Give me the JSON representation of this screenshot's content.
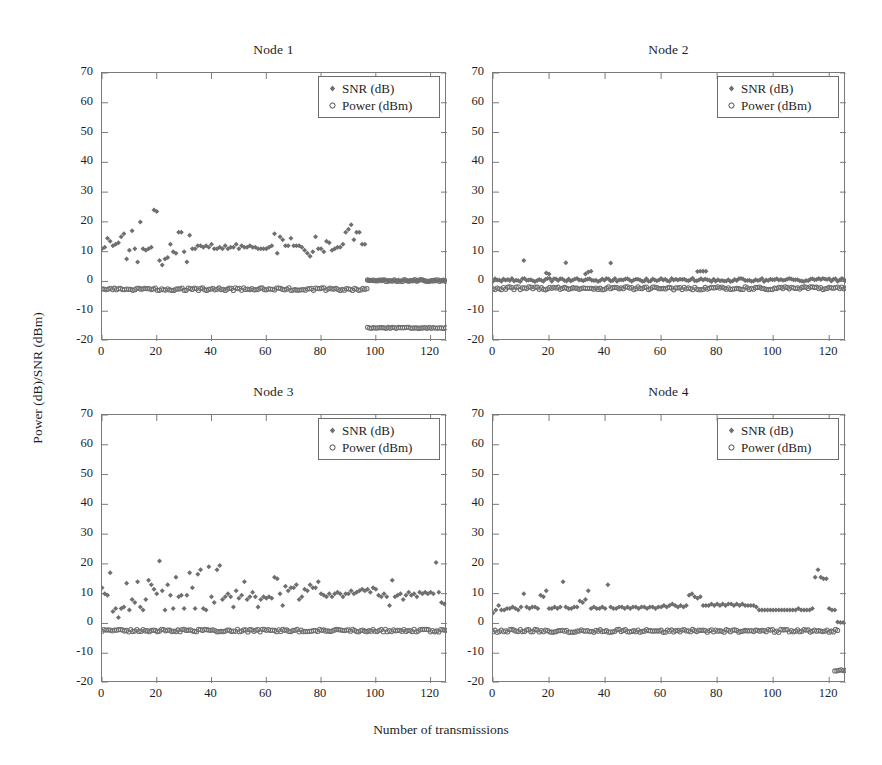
{
  "figure": {
    "ylabel": "Power (dB)/SNR (dBm)",
    "xlabel": "Number of transmissions",
    "marker_color": "#6f6f6f",
    "axis_color": "#7a7a7a",
    "text_color": "#1e1e1e"
  },
  "legend": {
    "snr_label": "SNR (dB)",
    "power_label": "Power (dBm)",
    "snr_marker": "diamond-marker-icon",
    "power_marker": "circle-marker-icon"
  },
  "axis": {
    "y_ticks": [
      "70",
      "60",
      "50",
      "40",
      "30",
      "20",
      "10",
      "0",
      "-10",
      "-20"
    ],
    "y_tick_values": [
      70,
      60,
      50,
      40,
      30,
      20,
      10,
      0,
      -10,
      -20
    ],
    "x_ticks": [
      "0",
      "20",
      "40",
      "60",
      "80",
      "100",
      "120"
    ],
    "x_tick_values": [
      0,
      20,
      40,
      60,
      80,
      100,
      120
    ],
    "xlim": [
      0,
      126
    ],
    "ylim": [
      -20,
      70
    ]
  },
  "chart_data": [
    {
      "type": "scatter",
      "title": "Node 1",
      "xlabel": "Number of transmissions",
      "ylabel": "Power (dB)/SNR (dBm)",
      "xlim": [
        0,
        126
      ],
      "ylim": [
        -20,
        70
      ],
      "grid": false,
      "legend_position": "top-right",
      "series": [
        {
          "name": "SNR (dB)",
          "marker": "diamond",
          "color": "#6f6f6f",
          "x": [
            0,
            1,
            2,
            3,
            4,
            5,
            6,
            7,
            8,
            9,
            10,
            11,
            12,
            13,
            14,
            15,
            16,
            17,
            18,
            19,
            20,
            21,
            22,
            23,
            24,
            25,
            26,
            27,
            28,
            29,
            30,
            31,
            32,
            33,
            34,
            35,
            36,
            37,
            38,
            39,
            40,
            41,
            42,
            43,
            44,
            45,
            46,
            47,
            48,
            49,
            50,
            51,
            52,
            53,
            54,
            55,
            56,
            57,
            58,
            59,
            60,
            61,
            62,
            63,
            64,
            65,
            66,
            67,
            68,
            69,
            70,
            71,
            72,
            73,
            74,
            75,
            76,
            77,
            78,
            79,
            80,
            81,
            82,
            83,
            84,
            85,
            86,
            87,
            88,
            89,
            90,
            91,
            92,
            93,
            94,
            95,
            96
          ],
          "y": [
            11.0,
            11.5,
            14.5,
            13.5,
            12.0,
            12.5,
            13.0,
            15.0,
            16.0,
            7.5,
            10.5,
            17.0,
            11.0,
            6.5,
            20.0,
            11.0,
            10.5,
            11.0,
            11.5,
            24.0,
            23.5,
            7.0,
            5.5,
            7.5,
            8.0,
            12.5,
            10.0,
            9.5,
            16.5,
            16.5,
            10.0,
            6.5,
            15.5,
            11.0,
            11.0,
            12.0,
            12.0,
            11.5,
            12.0,
            11.5,
            12.5,
            11.0,
            11.0,
            11.5,
            11.0,
            12.0,
            11.0,
            11.5,
            11.5,
            12.5,
            11.0,
            12.0,
            11.5,
            11.5,
            12.0,
            11.5,
            11.5,
            11.0,
            11.0,
            11.0,
            11.0,
            11.5,
            12.0,
            16.0,
            9.5,
            15.0,
            14.0,
            12.0,
            12.0,
            14.5,
            12.0,
            12.0,
            12.0,
            11.5,
            10.5,
            9.5,
            8.5,
            10.0,
            15.0,
            11.0,
            11.0,
            10.0,
            13.5,
            13.0,
            10.5,
            11.0,
            11.5,
            11.5,
            12.5,
            16.5,
            17.5,
            19.0,
            14.0,
            16.5,
            16.5,
            12.5,
            12.5
          ]
        },
        {
          "name": "Power (dBm) segment A",
          "marker": "circle",
          "color": "#6f6f6f",
          "x_range": [
            0,
            97
          ],
          "level": -2.6,
          "jitter": 0.45
        },
        {
          "name": "Power (dBm) segment B",
          "marker": "circle",
          "color": "#6f6f6f",
          "x_range": [
            97,
            126
          ],
          "level": 0.3,
          "jitter": 0.3
        },
        {
          "name": "Power (dBm) segment C",
          "marker": "circle",
          "color": "#6f6f6f",
          "x_range": [
            97,
            126
          ],
          "level": -15.6,
          "jitter": 0.2
        },
        {
          "name": "SNR (dB) tail",
          "marker": "diamond",
          "color": "#6f6f6f",
          "x_range": [
            97,
            126
          ],
          "level": 0.3,
          "jitter": 0.25
        }
      ]
    },
    {
      "type": "scatter",
      "title": "Node 2",
      "xlabel": "Number of transmissions",
      "ylabel": "Power (dB)/SNR (dBm)",
      "xlim": [
        0,
        126
      ],
      "ylim": [
        -20,
        70
      ],
      "grid": false,
      "legend_position": "top-right",
      "series": [
        {
          "name": "SNR (dB)",
          "marker": "diamond",
          "color": "#6f6f6f",
          "baseline": 0.5,
          "jitter": 0.55,
          "x_range": [
            0,
            126
          ],
          "outliers_x": [
            11,
            19,
            20,
            26,
            33,
            34,
            35,
            42,
            73,
            74,
            75,
            76
          ],
          "outliers_y": [
            7.0,
            2.8,
            2.5,
            6.3,
            2.5,
            3.2,
            3.4,
            6.2,
            3.3,
            3.4,
            3.4,
            3.4
          ]
        },
        {
          "name": "Power (dBm)",
          "marker": "circle",
          "color": "#6f6f6f",
          "x_range": [
            0,
            126
          ],
          "level": -2.3,
          "jitter": 0.5
        }
      ]
    },
    {
      "type": "scatter",
      "title": "Node 3",
      "xlabel": "Number of transmissions",
      "ylabel": "Power (dB)/SNR (dBm)",
      "xlim": [
        0,
        126
      ],
      "ylim": [
        -20,
        70
      ],
      "grid": false,
      "legend_position": "top-right",
      "series": [
        {
          "name": "SNR (dB)",
          "marker": "diamond",
          "color": "#6f6f6f",
          "x": [
            0,
            1,
            2,
            3,
            4,
            5,
            6,
            7,
            8,
            9,
            10,
            11,
            12,
            13,
            14,
            15,
            16,
            17,
            18,
            19,
            20,
            21,
            22,
            23,
            24,
            25,
            26,
            27,
            28,
            29,
            30,
            31,
            32,
            33,
            34,
            35,
            36,
            37,
            38,
            39,
            40,
            41,
            42,
            43,
            44,
            45,
            46,
            47,
            48,
            49,
            50,
            51,
            52,
            53,
            54,
            55,
            56,
            57,
            58,
            59,
            60,
            61,
            62,
            63,
            64,
            65,
            66,
            67,
            68,
            69,
            70,
            71,
            72,
            73,
            74,
            75,
            76,
            77,
            78,
            79,
            80,
            81,
            82,
            83,
            84,
            85,
            86,
            87,
            88,
            89,
            90,
            91,
            92,
            93,
            94,
            95,
            96,
            97,
            98,
            99,
            100,
            101,
            102,
            103,
            104,
            105,
            106,
            107,
            108,
            109,
            110,
            111,
            112,
            113,
            114,
            115,
            116,
            117,
            118,
            119,
            120,
            121,
            122,
            123,
            124,
            125
          ],
          "y": [
            12.0,
            10.0,
            9.5,
            17.0,
            4.0,
            5.0,
            2.0,
            5.0,
            5.5,
            13.5,
            4.5,
            8.0,
            7.0,
            14.0,
            5.5,
            4.5,
            8.0,
            14.5,
            13.0,
            11.5,
            10.0,
            21.0,
            11.0,
            4.5,
            13.0,
            9.5,
            5.0,
            15.5,
            9.0,
            9.5,
            5.0,
            9.5,
            17.0,
            12.0,
            5.0,
            16.5,
            18.0,
            5.0,
            4.5,
            19.0,
            9.0,
            7.0,
            18.0,
            19.5,
            8.0,
            9.0,
            10.0,
            9.0,
            5.5,
            11.0,
            8.5,
            9.5,
            14.0,
            8.0,
            9.0,
            10.5,
            9.0,
            5.5,
            8.0,
            9.0,
            8.5,
            9.0,
            8.5,
            15.5,
            15.0,
            10.0,
            6.0,
            12.5,
            11.0,
            12.0,
            12.0,
            13.0,
            8.0,
            9.0,
            11.5,
            11.0,
            13.0,
            12.0,
            12.0,
            14.0,
            10.0,
            9.5,
            9.0,
            10.0,
            9.0,
            10.0,
            10.5,
            10.0,
            9.0,
            10.0,
            10.0,
            11.0,
            10.0,
            10.5,
            11.0,
            11.5,
            11.0,
            11.5,
            10.5,
            12.0,
            11.5,
            9.5,
            9.0,
            10.0,
            9.0,
            6.0,
            14.5,
            9.0,
            9.5,
            10.0,
            8.0,
            9.5,
            10.5,
            9.5,
            10.0,
            9.0,
            10.5,
            10.0,
            10.5,
            10.0,
            10.5,
            10.0,
            20.5,
            10.5,
            7.0,
            6.5
          ]
        },
        {
          "name": "Power (dBm)",
          "marker": "circle",
          "color": "#6f6f6f",
          "x_range": [
            0,
            126
          ],
          "level": -2.4,
          "jitter": 0.45
        }
      ]
    },
    {
      "type": "scatter",
      "title": "Node 4",
      "xlabel": "Number of transmissions",
      "ylabel": "Power (dB)/SNR (dBm)",
      "xlim": [
        0,
        126
      ],
      "ylim": [
        -20,
        70
      ],
      "grid": false,
      "legend_position": "top-right",
      "series": [
        {
          "name": "SNR (dB)",
          "marker": "diamond",
          "color": "#6f6f6f",
          "x": [
            0,
            1,
            2,
            3,
            4,
            5,
            6,
            7,
            8,
            9,
            10,
            11,
            12,
            13,
            14,
            15,
            16,
            17,
            18,
            19,
            20,
            21,
            22,
            23,
            24,
            25,
            26,
            27,
            28,
            29,
            30,
            31,
            32,
            33,
            34,
            35,
            36,
            37,
            38,
            39,
            40,
            41,
            42,
            43,
            44,
            45,
            46,
            47,
            48,
            49,
            50,
            51,
            52,
            53,
            54,
            55,
            56,
            57,
            58,
            59,
            60,
            61,
            62,
            63,
            64,
            65,
            66,
            67,
            68,
            69,
            70,
            71,
            72,
            73,
            74,
            75,
            76,
            77,
            78,
            79,
            80,
            81,
            82,
            83,
            84,
            85,
            86,
            87,
            88,
            89,
            90,
            91,
            92,
            93,
            94,
            95,
            96,
            97,
            98,
            99,
            100,
            101,
            102,
            103,
            104,
            105,
            106,
            107,
            108,
            109,
            110,
            111,
            112,
            113,
            114,
            115,
            116,
            117,
            118,
            119,
            120,
            121,
            122,
            123,
            124,
            125
          ],
          "y": [
            3.5,
            4.5,
            6.0,
            4.5,
            4.5,
            5.0,
            5.0,
            5.5,
            5.0,
            4.5,
            5.5,
            10.0,
            5.5,
            5.0,
            5.5,
            5.5,
            5.0,
            9.5,
            9.0,
            11.0,
            5.0,
            5.0,
            5.5,
            5.0,
            5.5,
            14.0,
            5.5,
            5.0,
            5.0,
            5.5,
            5.5,
            7.5,
            7.0,
            8.0,
            11.0,
            5.0,
            5.5,
            5.0,
            5.0,
            5.5,
            5.0,
            13.0,
            5.5,
            5.0,
            5.0,
            5.5,
            5.5,
            5.0,
            5.5,
            5.0,
            5.5,
            5.5,
            5.0,
            5.5,
            5.5,
            5.0,
            5.5,
            5.5,
            5.0,
            5.5,
            5.5,
            6.0,
            5.5,
            6.0,
            6.5,
            6.0,
            5.5,
            6.0,
            5.5,
            6.0,
            9.5,
            10.0,
            9.0,
            8.5,
            9.0,
            6.0,
            6.0,
            6.0,
            6.5,
            6.0,
            6.5,
            6.0,
            6.5,
            6.0,
            6.5,
            6.5,
            6.0,
            6.5,
            6.0,
            6.5,
            6.0,
            6.0,
            6.0,
            6.0,
            5.5,
            4.5,
            4.5,
            4.5,
            4.5,
            4.5,
            4.5,
            4.5,
            4.5,
            4.5,
            4.5,
            4.5,
            4.5,
            4.5,
            4.5,
            5.0,
            4.5,
            4.5,
            4.5,
            4.5,
            5.0,
            15.5,
            18.0,
            15.5,
            15.0,
            15.0,
            5.0,
            4.5,
            4.5,
            0.5,
            0.3,
            0.3
          ]
        },
        {
          "name": "Power (dBm)",
          "marker": "circle",
          "color": "#6f6f6f",
          "x_range": [
            0,
            123
          ],
          "level": -2.5,
          "jitter": 0.5
        },
        {
          "name": "Power (dBm) outlier cluster",
          "marker": "circle",
          "color": "#6f6f6f",
          "x_range": [
            122,
            126
          ],
          "level": -15.8,
          "jitter": 0.25
        }
      ]
    }
  ],
  "panels": [
    {
      "title": "Node 1"
    },
    {
      "title": "Node 2"
    },
    {
      "title": "Node 3"
    },
    {
      "title": "Node 4"
    }
  ]
}
